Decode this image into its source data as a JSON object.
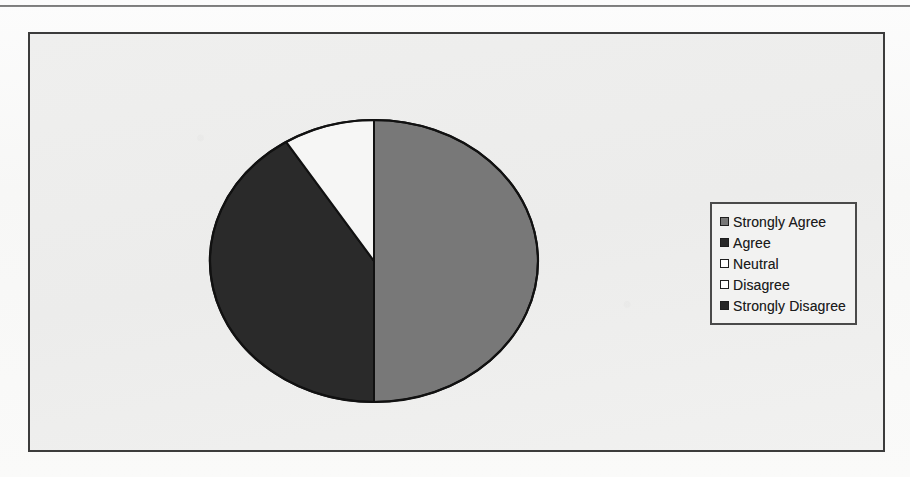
{
  "page": {
    "background_color": "#fbfbfb",
    "top_rule_color": "#565656"
  },
  "chart_frame": {
    "border_color": "#3c3c3c",
    "fill_color": "#efefee"
  },
  "legend": {
    "border_color": "#4a4a4a",
    "background_color": "#f2f2f1",
    "entries": [
      {
        "label": "Strongly Agree",
        "color": "#787878"
      },
      {
        "label": "Agree",
        "color": "#2a2a2a"
      },
      {
        "label": "Neutral",
        "color": "#ffffff"
      },
      {
        "label": "Disagree",
        "color": "#ffffff"
      },
      {
        "label": "Strongly Disagree",
        "color": "#262626"
      }
    ]
  },
  "chart_data": {
    "type": "pie",
    "title": "",
    "subtitle": "",
    "xlabel": "",
    "ylabel": "",
    "grid": false,
    "legend_position": "right",
    "start_angle_deg": 0,
    "direction": "clockwise",
    "center": {
      "x": 344,
      "y": 227
    },
    "radius_x": 164,
    "radius_y": 141,
    "outline_color": "#111111",
    "categories": [
      "Strongly Agree",
      "Agree",
      "Neutral",
      "Disagree",
      "Strongly Disagree"
    ],
    "values": [
      50,
      41,
      9,
      0,
      0
    ],
    "units": "percent",
    "slices": [
      {
        "label": "Strongly Agree",
        "value": 50,
        "color": "#787878",
        "start_deg": 0,
        "end_deg": 180
      },
      {
        "label": "Agree",
        "value": 41,
        "color": "#2a2a2a",
        "start_deg": 180,
        "end_deg": 327.6
      },
      {
        "label": "Neutral",
        "value": 9,
        "color": "#f6f6f5",
        "start_deg": 327.6,
        "end_deg": 360
      },
      {
        "label": "Disagree",
        "value": 0,
        "color": "#ffffff",
        "start_deg": 360,
        "end_deg": 360
      },
      {
        "label": "Strongly Disagree",
        "value": 0,
        "color": "#262626",
        "start_deg": 360,
        "end_deg": 360
      }
    ]
  },
  "ghost_text": [
    {
      "x": 60,
      "y": 60,
      "w": 470,
      "light": false
    },
    {
      "x": 548,
      "y": 60,
      "w": 290,
      "light": true
    },
    {
      "x": 60,
      "y": 88,
      "w": 300,
      "light": false
    },
    {
      "x": 380,
      "y": 88,
      "w": 440,
      "light": true
    },
    {
      "x": 60,
      "y": 116,
      "w": 225,
      "light": false
    },
    {
      "x": 300,
      "y": 116,
      "w": 520,
      "light": true
    },
    {
      "x": 60,
      "y": 144,
      "w": 190,
      "light": true
    },
    {
      "x": 268,
      "y": 144,
      "w": 555,
      "light": false
    },
    {
      "x": 60,
      "y": 172,
      "w": 150,
      "light": true
    },
    {
      "x": 60,
      "y": 200,
      "w": 128,
      "light": true
    },
    {
      "x": 60,
      "y": 256,
      "w": 112,
      "light": true
    },
    {
      "x": 548,
      "y": 336,
      "w": 220,
      "light": true
    },
    {
      "x": 78,
      "y": 364,
      "w": 128,
      "light": true
    },
    {
      "x": 238,
      "y": 392,
      "w": 180,
      "light": true
    },
    {
      "x": 540,
      "y": 392,
      "w": 240,
      "light": true
    },
    {
      "x": 40,
      "y": 438,
      "w": 200,
      "light": true
    },
    {
      "x": 300,
      "y": 438,
      "w": 420,
      "light": true
    }
  ]
}
